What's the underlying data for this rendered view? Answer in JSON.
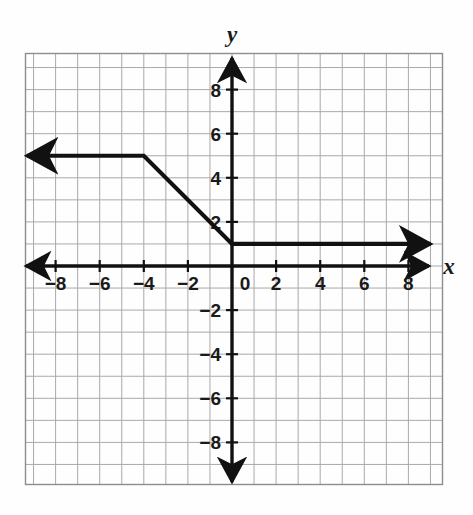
{
  "figure": {
    "kind": "coordinate-plane-graph",
    "axis_labels": {
      "x": "x",
      "y": "y"
    },
    "background_color": "#fefefe",
    "grid_color": "#a9a9a9",
    "axis_color": "#111111",
    "curve_color": "#111111"
  },
  "chart_data": {
    "type": "line",
    "title": "",
    "xlabel": "x",
    "ylabel": "y",
    "xlim": [
      -9.5,
      9.5
    ],
    "ylim": [
      -9.5,
      9.5
    ],
    "grid": true,
    "grid_step": 1,
    "legend_position": "none",
    "x_tick_labels": [
      "−8",
      "−6",
      "−4",
      "−2",
      "0",
      "2",
      "4",
      "6",
      "8"
    ],
    "x_tick_values": [
      -8,
      -6,
      -4,
      -2,
      0,
      2,
      4,
      6,
      8
    ],
    "y_tick_labels": [
      "8",
      "6",
      "4",
      "2",
      "−2",
      "−4",
      "−6",
      "−8"
    ],
    "y_tick_values": [
      8,
      6,
      4,
      2,
      -2,
      -4,
      -6,
      -8
    ],
    "series": [
      {
        "name": "piecewise function",
        "points": [
          [
            -9.3,
            5
          ],
          [
            -4,
            5
          ],
          [
            0,
            1
          ],
          [
            9.0,
            1
          ]
        ],
        "arrow_start": true,
        "arrow_end": true,
        "segments": [
          {
            "description": "horizontal ray y = 5 for x ≤ −4",
            "from": [
              -9.3,
              5
            ],
            "to": [
              -4,
              5
            ],
            "slope": 0
          },
          {
            "description": "line segment from (−4, 5) to (0, 1)",
            "from": [
              -4,
              5
            ],
            "to": [
              0,
              1
            ],
            "slope": -1
          },
          {
            "description": "horizontal ray y = 1 for x ≥ 0",
            "from": [
              0,
              1
            ],
            "to": [
              9.0,
              1
            ],
            "slope": 0
          }
        ],
        "vertices": [
          [
            -4,
            5
          ],
          [
            0,
            1
          ]
        ]
      }
    ]
  }
}
